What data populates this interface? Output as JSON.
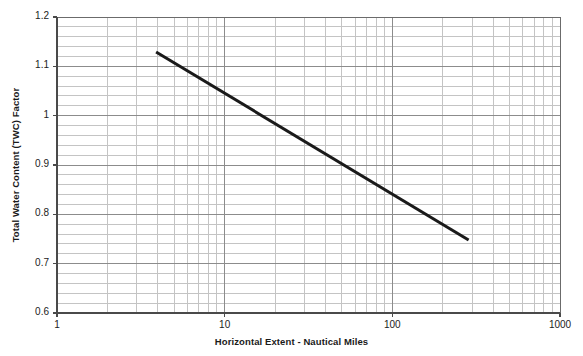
{
  "chart_data": {
    "type": "line",
    "title": "",
    "xlabel": "Horizontal Extent - Nautical Miles",
    "ylabel": "Total Water Content (TWC) Factor",
    "xscale": "log",
    "yscale": "linear",
    "xlim": [
      1,
      1000
    ],
    "ylim": [
      0.6,
      1.2
    ],
    "grid": true,
    "grid_major_color": "#8c8c8c",
    "grid_minor_color": "#c4c4c4",
    "legend": null,
    "line_color": "#1a1a1a",
    "line_width": 3,
    "xticks": [
      1,
      10,
      100,
      1000
    ],
    "xtick_labels": [
      "1",
      "10",
      "100",
      "1000"
    ],
    "x_minor_ticks": [
      2,
      3,
      4,
      5,
      6,
      7,
      8,
      9,
      20,
      30,
      40,
      50,
      60,
      70,
      80,
      90,
      200,
      300,
      400,
      500,
      600,
      700,
      800,
      900
    ],
    "yticks": [
      0.6,
      0.7,
      0.8,
      0.9,
      1.0,
      1.1,
      1.2
    ],
    "ytick_labels": [
      "0.6",
      "0.7",
      "0.8",
      "0.9",
      "1",
      "1.1",
      "1.2"
    ],
    "y_minor_step": 0.02,
    "series": [
      {
        "name": "TWC Factor",
        "x": [
          3.9,
          285
        ],
        "y": [
          1.129,
          0.748
        ]
      }
    ]
  }
}
